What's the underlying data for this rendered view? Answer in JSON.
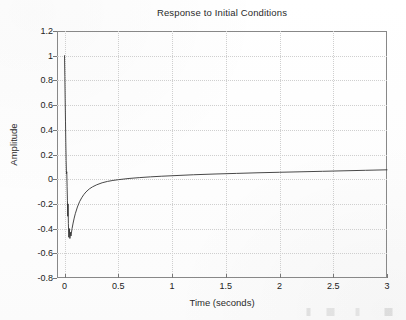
{
  "figure": {
    "title": "Response to Initial Conditions",
    "background_color": "#fefefe",
    "axis_color": "#888888",
    "grid_color": "#cfcfcf",
    "curve_color": "#333333"
  },
  "chart_data": {
    "type": "line",
    "title": "Response to Initial Conditions",
    "xlabel": "Time (seconds)",
    "ylabel": "Amplitude",
    "xlim": [
      -0.07,
      3.0
    ],
    "ylim": [
      -0.8,
      1.2
    ],
    "xticks": [
      0,
      0.5,
      1,
      1.5,
      2,
      2.5,
      3
    ],
    "xtick_labels": [
      "0",
      "0.5",
      "1",
      "1.5",
      "2",
      "2.5",
      "3"
    ],
    "yticks": [
      -0.8,
      -0.6,
      -0.4,
      -0.2,
      0,
      0.2,
      0.4,
      0.6,
      0.8,
      1,
      1.2
    ],
    "ytick_labels": [
      "-0.8",
      "-0.6",
      "-0.4",
      "-0.2",
      "0",
      "0.2",
      "0.4",
      "0.6",
      "0.8",
      "1",
      "1.2"
    ],
    "grid": true,
    "legend": null,
    "series": [
      {
        "name": "initial condition response",
        "color": "#333333",
        "description": "Starts near 1.0 at t=0, plunges with fast decaying oscillation to a minimum of about -0.48 near t=0.03, then recovers exponentially and settles slowly rising toward about +0.07 at t=3.",
        "x": [
          0.0,
          0.003,
          0.006,
          0.009,
          0.012,
          0.015,
          0.018,
          0.021,
          0.024,
          0.027,
          0.03,
          0.033,
          0.036,
          0.04,
          0.045,
          0.05,
          0.055,
          0.06,
          0.07,
          0.08,
          0.09,
          0.1,
          0.12,
          0.14,
          0.16,
          0.18,
          0.2,
          0.23,
          0.26,
          0.3,
          0.35,
          0.4,
          0.45,
          0.5,
          0.6,
          0.7,
          0.8,
          0.9,
          1.0,
          1.2,
          1.4,
          1.6,
          1.8,
          2.0,
          2.2,
          2.4,
          2.6,
          2.8,
          3.0
        ],
        "y": [
          1.0,
          0.83,
          0.65,
          0.47,
          0.3,
          0.15,
          0.045,
          0.06,
          -0.06,
          -0.17,
          -0.3,
          -0.2,
          -0.36,
          -0.47,
          -0.4,
          -0.48,
          -0.43,
          -0.46,
          -0.4,
          -0.355,
          -0.315,
          -0.28,
          -0.225,
          -0.182,
          -0.15,
          -0.124,
          -0.103,
          -0.079,
          -0.062,
          -0.045,
          -0.029,
          -0.018,
          -0.01,
          -0.004,
          0.006,
          0.013,
          0.019,
          0.024,
          0.028,
          0.036,
          0.042,
          0.047,
          0.052,
          0.056,
          0.06,
          0.064,
          0.068,
          0.072,
          0.076
        ]
      }
    ],
    "annotations": {
      "initial_value": 1.0,
      "minimum_value": -0.48,
      "minimum_time": 0.03,
      "final_value": 0.076
    }
  }
}
